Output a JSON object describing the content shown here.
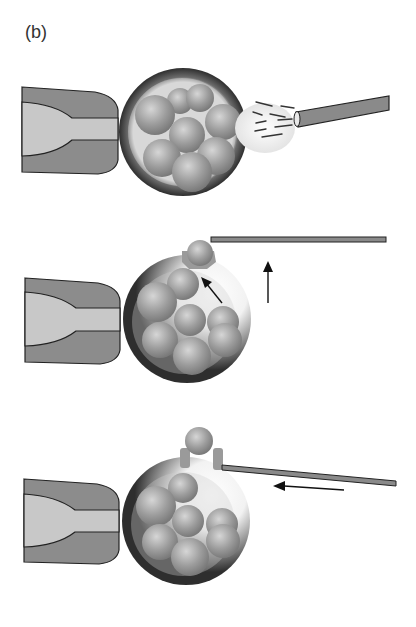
{
  "figure": {
    "label": "(b)",
    "panels": [
      {
        "id": "step-1",
        "description": "Laser/drill pulse opens zona pellucida next to embryo held by holding pipette"
      },
      {
        "id": "step-2",
        "description": "Blastomere extruded through opening; biopsy pipette approaches upward"
      },
      {
        "id": "step-3",
        "description": "Biopsy pipette slides in leftward beneath extruded blastomere"
      }
    ],
    "arrows": {
      "step2_internal": "up-left",
      "step2_pipette": "up",
      "step3_pipette": "left"
    }
  },
  "colors": {
    "holder_outer": "#8c8c8c",
    "holder_inner": "#c8c8c8",
    "zona": "#3a3a3a",
    "cell": "#a5a5a5",
    "pipette": "#8a8a8a",
    "stroke": "#222222",
    "spray_halo": "#e8e8e8"
  }
}
